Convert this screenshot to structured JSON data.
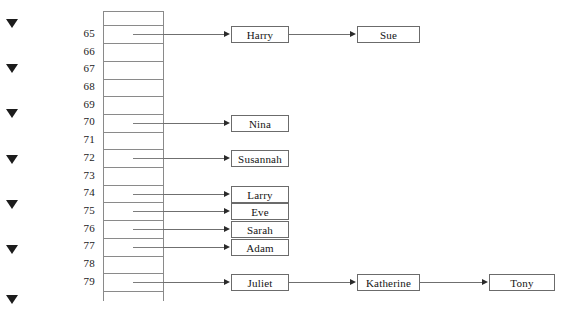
{
  "diagram": {
    "background_color": "#ffffff",
    "line_color": "#8a8a8a",
    "box_border_color": "#6b6b6b",
    "text_color": "#1a1a1a",
    "marker_color": "#1c1c1c"
  },
  "markers": [
    {
      "name": "marker-1",
      "glyph": "▼"
    },
    {
      "name": "marker-2",
      "glyph": "▼"
    },
    {
      "name": "marker-3",
      "glyph": "▼"
    },
    {
      "name": "marker-4",
      "glyph": "▼"
    },
    {
      "name": "marker-5",
      "glyph": "▼"
    },
    {
      "name": "marker-6",
      "glyph": "▼"
    },
    {
      "name": "marker-7",
      "glyph": "▼"
    }
  ],
  "table": {
    "first_index": 65,
    "last_index": 79,
    "row_count": 15,
    "indices": [
      "65",
      "66",
      "67",
      "68",
      "69",
      "70",
      "71",
      "72",
      "73",
      "74",
      "75",
      "76",
      "77",
      "78",
      "79"
    ]
  },
  "chains": [
    {
      "index": "65",
      "names": [
        "Harry",
        "Sue"
      ]
    },
    {
      "index": "66",
      "names": []
    },
    {
      "index": "67",
      "names": []
    },
    {
      "index": "68",
      "names": []
    },
    {
      "index": "69",
      "names": []
    },
    {
      "index": "70",
      "names": [
        "Nina"
      ]
    },
    {
      "index": "71",
      "names": []
    },
    {
      "index": "72",
      "names": [
        "Susannah"
      ]
    },
    {
      "index": "73",
      "names": []
    },
    {
      "index": "74",
      "names": [
        "Larry"
      ]
    },
    {
      "index": "75",
      "names": [
        "Eve"
      ]
    },
    {
      "index": "76",
      "names": [
        "Sarah"
      ]
    },
    {
      "index": "77",
      "names": [
        "Adam"
      ]
    },
    {
      "index": "78",
      "names": []
    },
    {
      "index": "79",
      "names": [
        "Juliet",
        "Katherine",
        "Tony"
      ]
    }
  ]
}
